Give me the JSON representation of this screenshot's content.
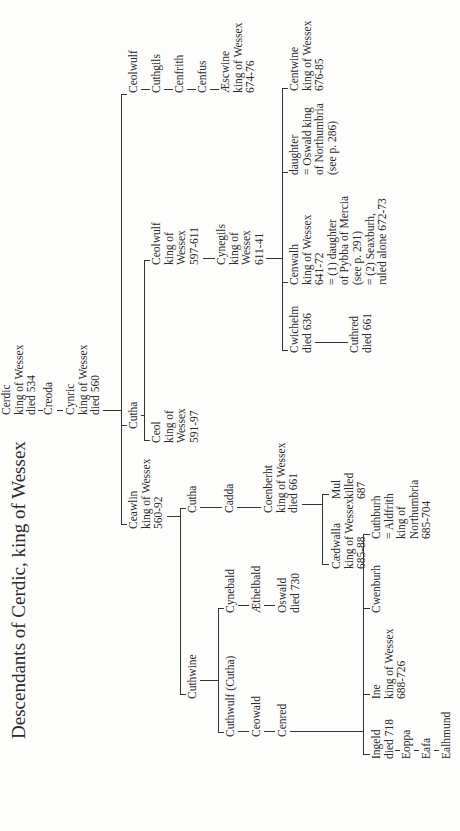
{
  "title": "Descendants of Cerdic, king of Wessex",
  "nodes": {
    "cerdic": [
      "Cerdic",
      "king of Wessex",
      "died 534"
    ],
    "creoda": [
      "Creoda"
    ],
    "cynric": [
      "Cynric",
      "king of Wessex",
      "died 560"
    ],
    "ceawlin": [
      "Ceawlin",
      "king of Wessex",
      "560-92"
    ],
    "cutha1": [
      "Cutha"
    ],
    "ceolwulf1": [
      "Ceolwulf"
    ],
    "cuthgils": [
      "Cuthgils"
    ],
    "cenfrith": [
      "Cenfrith"
    ],
    "cenfus": [
      "Cenfus"
    ],
    "aescwine": [
      "Æscwine",
      "king of Wessex",
      "674-76"
    ],
    "ceol": [
      "Ceol",
      "king of",
      "Wessex",
      "591-97"
    ],
    "ceolwulf2": [
      "Ceolwulf",
      "king of",
      "Wessex",
      "597-611"
    ],
    "cynegils": [
      "Cynegils",
      "king of",
      "Wessex",
      "611-41"
    ],
    "cwichelm": [
      "Cwichelm",
      "died 636"
    ],
    "cuthred": [
      "Cuthred",
      "died 661"
    ],
    "cenwalh": [
      "Cenwalh",
      "king of Wessex",
      "641-72",
      "= (1) daughter",
      "of Pybba of Mercia",
      "(see p. 291)",
      "= (2) Seaxburh,",
      "ruled alone 672-73"
    ],
    "daughter": [
      "daughter",
      "= Oswald king",
      "of Northumbria",
      "(see p. 286)"
    ],
    "centwine": [
      "Centwine",
      "king of Wessex",
      "676-85"
    ],
    "cuthwine": [
      "Cuthwine"
    ],
    "cutha2": [
      "Cutha"
    ],
    "cadda": [
      "Cadda"
    ],
    "coenberht": [
      "Coenberht",
      "king of Wessex",
      "died 661"
    ],
    "caedwalla": [
      "Cædwalla",
      "king of Wessex",
      "685-88"
    ],
    "mul": [
      "Mul",
      "killed",
      "687"
    ],
    "cuthwulf": [
      "Cuthwulf (Cutha)"
    ],
    "ceowald": [
      "Ceowald"
    ],
    "cenred": [
      "Cenred"
    ],
    "cynebald": [
      "Cynebald"
    ],
    "aethelbald": [
      "Æthelbald"
    ],
    "oswald": [
      "Oswald",
      "died 730"
    ],
    "ingeld": [
      "Ingeld",
      "died 718"
    ],
    "eoppa": [
      "Eoppa"
    ],
    "eafa": [
      "Eafa"
    ],
    "ealhmund": [
      "Ealhmund"
    ],
    "ine": [
      "Ine",
      "king of Wessex",
      "688-726"
    ],
    "cwenburh": [
      "Cwenburh"
    ],
    "cuthburh": [
      "Cuthburh",
      "= Aldfrith",
      "king of",
      "Northumbria",
      "685-704"
    ]
  }
}
